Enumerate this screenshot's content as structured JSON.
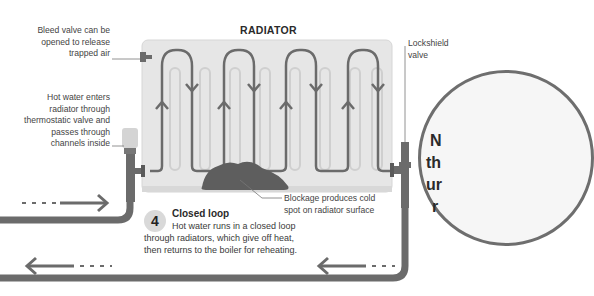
{
  "diagram": {
    "title": "RADIATOR",
    "labels": {
      "bleed_valve": [
        "Bleed valve can be",
        "opened to release",
        "trapped air"
      ],
      "hot_water_enters": [
        "Hot water enters",
        "radiator through",
        "thermostatic valve and",
        "passes through",
        "channels inside"
      ],
      "lockshield_valve": [
        "Lockshield",
        "valve"
      ],
      "blockage": [
        "Blockage produces cold",
        "spot on radiator surface"
      ]
    },
    "step": {
      "number": "4",
      "heading": "Closed loop",
      "body": [
        "Hot water runs in a closed loop",
        "through radiators, which give off heat,",
        "then returns to the boiler for reheating."
      ]
    },
    "side_circle": {
      "partial_lines": [
        "N",
        "th",
        "ur",
        "r"
      ]
    },
    "colors": {
      "pipe": "#6b6b6b",
      "radiator_fill": "#e6e6e6",
      "channel": "#d2d2d2",
      "blockage": "#5e5e5e",
      "badge": "#d9d9d9"
    }
  }
}
